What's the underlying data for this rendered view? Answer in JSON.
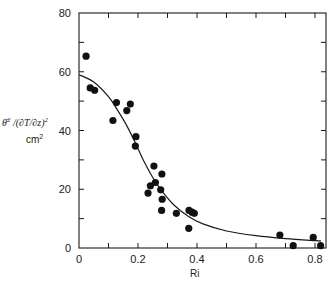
{
  "chart_data": {
    "type": "scatter",
    "title": "",
    "xlabel": "Ri",
    "ylabel": "θ̄²/(∂T/∂z)²",
    "ylabel_units": "cm²",
    "xlim": [
      0,
      0.84
    ],
    "ylim": [
      0,
      80
    ],
    "x_ticks": [
      0,
      0.2,
      0.4,
      0.6,
      0.8
    ],
    "x_tick_labels": [
      "0",
      "0.2",
      "0.4",
      "0.6",
      "0.8"
    ],
    "x_minor_ticks": [
      0.1,
      0.3,
      0.5,
      0.7
    ],
    "y_ticks": [
      0,
      20,
      40,
      60,
      80
    ],
    "y_tick_labels": [
      "0",
      "20",
      "40",
      "60",
      "80"
    ],
    "y_minor_ticks": [
      10,
      30,
      50,
      70
    ],
    "grid": false,
    "legend": null,
    "series": [
      {
        "name": "observations",
        "kind": "points",
        "x": [
          0.024,
          0.038,
          0.053,
          0.115,
          0.127,
          0.162,
          0.174,
          0.191,
          0.193,
          0.234,
          0.242,
          0.254,
          0.259,
          0.277,
          0.28,
          0.281,
          0.282,
          0.33,
          0.372,
          0.373,
          0.383,
          0.391,
          0.681,
          0.726,
          0.794,
          0.819
        ],
        "y": [
          65.3,
          54.5,
          53.7,
          43.4,
          49.5,
          46.8,
          49.0,
          34.7,
          37.9,
          18.7,
          21.2,
          27.9,
          22.3,
          19.8,
          12.8,
          25.2,
          16.6,
          11.8,
          6.7,
          12.8,
          12.2,
          11.8,
          4.4,
          0.8,
          3.6,
          0.8
        ]
      },
      {
        "name": "fitted curve",
        "kind": "line",
        "x": [
          0.0,
          0.05,
          0.1,
          0.13,
          0.16,
          0.19,
          0.22,
          0.25,
          0.28,
          0.32,
          0.37,
          0.42,
          0.5,
          0.6,
          0.7,
          0.8,
          0.82
        ],
        "y": [
          59.0,
          56.5,
          51.5,
          47.0,
          42.0,
          36.0,
          29.5,
          24.0,
          19.5,
          14.8,
          10.8,
          8.2,
          5.8,
          4.2,
          3.2,
          2.5,
          2.4
        ]
      }
    ]
  }
}
